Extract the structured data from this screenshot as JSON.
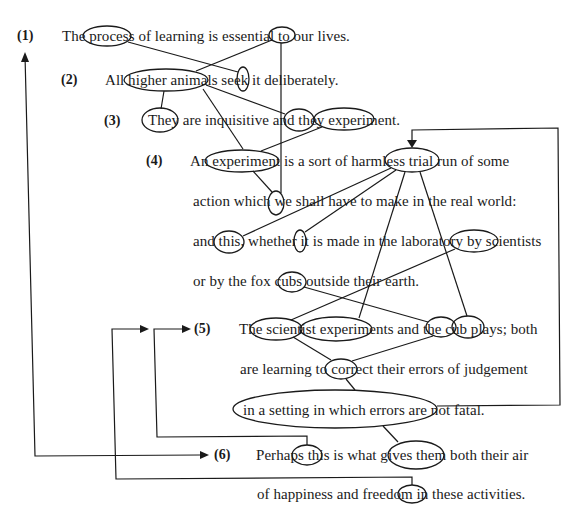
{
  "diagram": {
    "title": "",
    "type": "cohesion / reference chain diagram",
    "sentences": [
      {
        "number": "(1)",
        "text": "The process of learning is essential to our lives."
      },
      {
        "number": "(2)",
        "text": "All higher animals seek it deliberately."
      },
      {
        "number": "(3)",
        "text": "They are inquisitive and they experiment."
      },
      {
        "number": "(4)",
        "lines": [
          "An experiment is a sort of harmless trial run of some",
          "action which we shall have to make in the real world:",
          "and this, whether it is made in the laboratory by scientists",
          "or by the fox cubs outside their earth."
        ]
      },
      {
        "number": "(5)",
        "lines": [
          "The scientist experiments and the cub plays; both",
          "are learning to correct their errors of judgement",
          "in a setting in which errors are not fatal."
        ]
      },
      {
        "number": "(6)",
        "lines": [
          "Perhaps this is what gives them both their air",
          "of happiness and freedom in these activities."
        ]
      }
    ],
    "circled_terms": [
      "process",
      "our",
      "higher animals",
      "it",
      "They",
      "they",
      "experiment",
      "experiment",
      "trial run",
      "we",
      "this",
      "it",
      "scientists",
      "cubs",
      "scientist",
      "experiments",
      "cub",
      "plays",
      "their",
      "in a setting in which errors are not fatal.",
      "this",
      "them both",
      "these"
    ],
    "links": [
      {
        "from": "process",
        "to": "it"
      },
      {
        "from": "our",
        "to": "higher animals"
      },
      {
        "from": "our",
        "to": "we"
      },
      {
        "from": "higher animals",
        "to": "They"
      },
      {
        "from": "higher animals",
        "to": "they"
      },
      {
        "from": "higher animals",
        "to": "we"
      },
      {
        "from": "experiment (3)",
        "to": "experiment (4)"
      },
      {
        "from": "experiment (4)",
        "to": "we"
      },
      {
        "from": "trial run",
        "to": "this"
      },
      {
        "from": "trial run",
        "to": "it"
      },
      {
        "from": "trial run",
        "to": "experiments"
      },
      {
        "from": "trial run",
        "to": "plays"
      },
      {
        "from": "scientists",
        "to": "scientist"
      },
      {
        "from": "cubs",
        "to": "cub"
      },
      {
        "from": "scientist",
        "to": "their"
      },
      {
        "from": "cub",
        "to": "their"
      },
      {
        "from": "their",
        "to": "in a setting in which errors are not fatal."
      },
      {
        "from": "in a setting in which errors are not fatal.",
        "to": "them both"
      },
      {
        "from": "in a setting ... (right edge)",
        "to": "trial run",
        "style": "arrow-loop"
      },
      {
        "from": "this (6)",
        "to": "(5)",
        "style": "arrow-loop"
      },
      {
        "from": "these (6)",
        "to": "(5)",
        "style": "arrow-loop"
      },
      {
        "from": "(6) left loop",
        "to": "(1)",
        "style": "arrow-double"
      }
    ]
  },
  "text": {
    "n1": "(1)",
    "n2": "(2)",
    "n3": "(3)",
    "n4": "(4)",
    "n5": "(5)",
    "n6": "(6)",
    "s1": "The process of learning is essential to our lives.",
    "s2": "All higher animals seek it deliberately.",
    "s3": "They are inquisitive and they experiment.",
    "s4a": "An experiment is a sort of harmless trial run of some",
    "s4b": "action which we shall have to make in the real world:",
    "s4c": "and this, whether it is made in the laboratory by scientists",
    "s4d": "or by the fox cubs outside their earth.",
    "s5a": "The scientist experiments and the cub plays; both",
    "s5b": "are learning to correct their errors of judgement",
    "s5c": "in a setting in which errors are not fatal.",
    "s6a": "Perhaps this is what gives them both their air",
    "s6b": "of happiness and freedom in these activities."
  },
  "colors": {
    "ink": "#1a1a1a",
    "background": "#ffffff"
  }
}
